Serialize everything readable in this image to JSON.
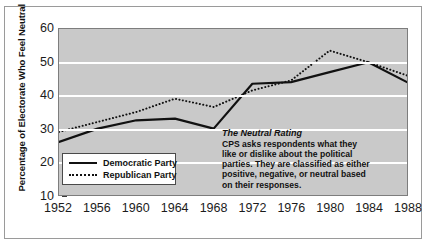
{
  "axes": {
    "ylabel": "Percentage of Electorate Who Feel Neutral",
    "yticks": [
      "60",
      "50",
      "40",
      "30",
      "20",
      "10"
    ],
    "xticks": [
      "1952",
      "1956",
      "1960",
      "1964",
      "1968",
      "1972",
      "1976",
      "1980",
      "1984",
      "1988"
    ]
  },
  "legend": {
    "items": [
      {
        "label": "Democratic Party",
        "style": "solid"
      },
      {
        "label": "Republican Party",
        "style": "dotted"
      }
    ]
  },
  "annotation": {
    "title": "The Neutral Rating",
    "lines": [
      "CPS asks respondents what they",
      "like or dislike about the political",
      "parties. They are classified as either",
      "positive, negative, or neutral based",
      "on their responses."
    ]
  },
  "colors": {
    "plot_background": "#c9c9c9",
    "gridline": "#ffffff",
    "line": "#111111",
    "frame": "#7d7d7d",
    "page_background": "#ffffff"
  },
  "chart_data": {
    "type": "line",
    "title": "",
    "xlabel": "",
    "ylabel": "Percentage of Electorate Who Feel Neutral",
    "categories": [
      1952,
      1956,
      1960,
      1964,
      1968,
      1972,
      1976,
      1980,
      1984,
      1988
    ],
    "xlim": [
      1952,
      1988
    ],
    "ylim": [
      10,
      60
    ],
    "yticks": [
      10,
      20,
      30,
      40,
      50,
      60
    ],
    "grid": "horizontal",
    "legend_position": "bottom-left",
    "series": [
      {
        "name": "Democratic Party",
        "style": "solid",
        "values": [
          26.0,
          30.0,
          32.5,
          33.0,
          30.0,
          43.5,
          44.0,
          47.0,
          50.0,
          44.0
        ]
      },
      {
        "name": "Republican Party",
        "style": "dotted",
        "values": [
          29.0,
          32.0,
          35.0,
          39.0,
          36.5,
          41.5,
          44.5,
          53.5,
          50.0,
          46.0
        ]
      }
    ]
  }
}
